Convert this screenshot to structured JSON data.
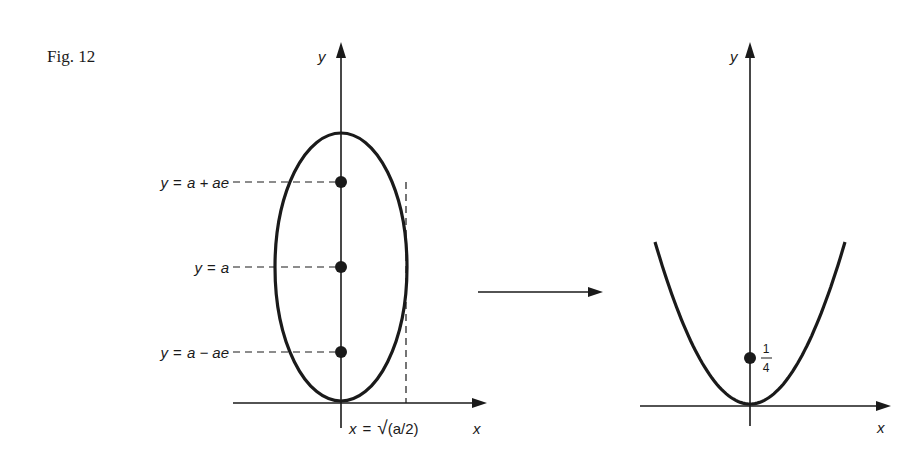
{
  "caption": "Fig. 12",
  "left_panel": {
    "y_axis_label": "y",
    "x_axis_label": "x",
    "curve": "ellipse",
    "marked_points": [
      {
        "label_lhs": "y",
        "label_eq": "=",
        "label_rhs": "a + ae"
      },
      {
        "label_lhs": "y",
        "label_eq": "=",
        "label_rhs": "a"
      },
      {
        "label_lhs": "y",
        "label_eq": "=",
        "label_rhs": "a − ae"
      }
    ],
    "vertical_line_label": {
      "lhs": "x",
      "eq": "=",
      "sqrt": "√",
      "rhs": "(a/2)"
    }
  },
  "transform_arrow": "arrow-right",
  "right_panel": {
    "y_axis_label": "y",
    "x_axis_label": "x",
    "curve": "parabola",
    "marked_point": {
      "numerator": "1",
      "denominator": "4"
    }
  }
}
